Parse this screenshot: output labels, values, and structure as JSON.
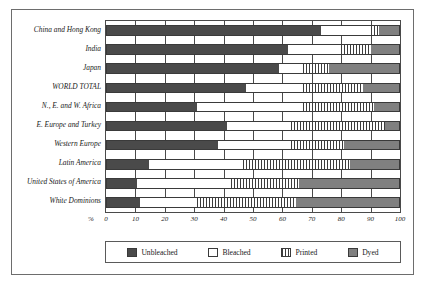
{
  "chart_data": {
    "type": "bar",
    "orientation": "horizontal",
    "stacked": true,
    "title": "",
    "xlabel": "%",
    "ylabel": "",
    "xlim": [
      0,
      100
    ],
    "xticks": [
      0,
      10,
      20,
      30,
      40,
      50,
      60,
      70,
      80,
      90,
      100
    ],
    "grid": true,
    "legend_position": "bottom",
    "categories": [
      "China and Hong Kong",
      "India",
      "Japan",
      "WORLD TOTAL",
      "N., E. and W. Africa",
      "E. Europe and Turkey",
      "Western Europe",
      "Latin America",
      "United States of America",
      "White Dominions"
    ],
    "series": [
      {
        "name": "Unbleached",
        "color": "#4a4a4a",
        "values": [
          73,
          62,
          59,
          47.5,
          31,
          41,
          38,
          14.5,
          10.5,
          11.5
        ]
      },
      {
        "name": "Bleached",
        "color": "#ffffff",
        "values": [
          17,
          18,
          8,
          19.5,
          36,
          22,
          25,
          32,
          32,
          19.5
        ]
      },
      {
        "name": "Printed",
        "color": "#3c3c3c",
        "values": [
          3,
          10,
          9,
          20.5,
          24,
          32,
          18,
          36.5,
          23,
          33.5
        ]
      },
      {
        "name": "Dyed",
        "color": "#808080",
        "values": [
          7,
          10,
          24,
          12.5,
          9,
          5,
          19,
          17,
          34.5,
          35.5
        ]
      }
    ]
  },
  "axis": {
    "percent_symbol": "%",
    "tick_labels": [
      "0",
      "10",
      "20",
      "30",
      "40",
      "50",
      "60",
      "70",
      "80",
      "90",
      "100"
    ]
  },
  "legend": {
    "items": [
      {
        "label": "Unbleached",
        "swatch": "unbleached"
      },
      {
        "label": "Bleached",
        "swatch": "bleached"
      },
      {
        "label": "Printed",
        "swatch": "printed"
      },
      {
        "label": "Dyed",
        "swatch": "dyed"
      }
    ]
  }
}
